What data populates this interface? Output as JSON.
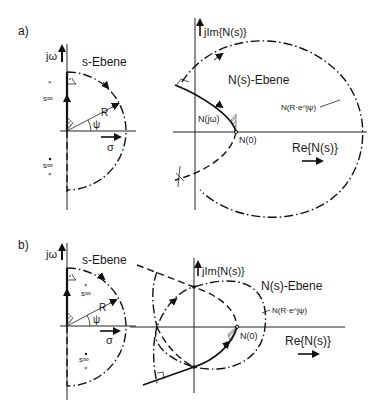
{
  "figure": {
    "panel_a": {
      "label": "a)",
      "s_plane": {
        "title": "s-Ebene",
        "y_axis": "jω",
        "x_axis": "σ",
        "radius_label": "R",
        "angle_label": "ψ",
        "pole_upper": "s∞",
        "pole_lower": "s∞"
      },
      "n_plane": {
        "title": "N(s)-Ebene",
        "y_axis": "jIm{N(s)}",
        "x_axis": "Re{N(s)}",
        "curve_label": "N(jω)",
        "origin_label": "N(0)",
        "arc_label": "N(R·e^jψ)"
      }
    },
    "panel_b": {
      "label": "b)",
      "s_plane": {
        "title": "s-Ebene",
        "y_axis": "jω",
        "x_axis": "σ",
        "radius_label": "R",
        "angle_label": "ψ",
        "pole_upper": "s∞",
        "pole_lower": "s∞"
      },
      "n_plane": {
        "title": "N(s)-Ebene",
        "y_axis": "jIm{N(s)}",
        "x_axis": "Re{N(s)}",
        "origin_label": "N(0)",
        "arc_label": "N(R·e^jψ)"
      }
    }
  }
}
